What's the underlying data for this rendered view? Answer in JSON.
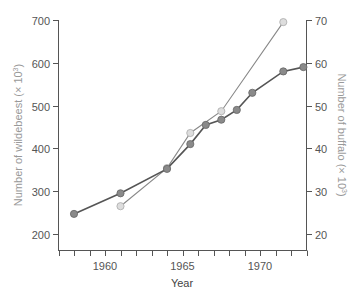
{
  "chart_data": {
    "type": "line",
    "title": "",
    "xlabel": "Year",
    "ylabel_left": "Number of wildebeest (× 10³)",
    "ylabel_right": "Number of buffalo (× 10³)",
    "xlim": [
      1957,
      1973
    ],
    "ylim_left": [
      170,
      700
    ],
    "ylim_right": [
      16,
      70
    ],
    "x_ticks": [
      1960,
      1965,
      1970
    ],
    "y_ticks_left": [
      200,
      300,
      400,
      500,
      600,
      700
    ],
    "y_ticks_right": [
      20,
      30,
      40,
      50,
      60,
      70
    ],
    "grid": false,
    "legend": null,
    "series": [
      {
        "name": "Wildebeest",
        "axis": "left",
        "color": "#555555",
        "marker_fill": "#8a8a8a",
        "x": [
          1958,
          1961,
          1964,
          1965.5,
          1966.5,
          1967.5,
          1968.5,
          1969.5,
          1971.5,
          1972.8
        ],
        "values": [
          247,
          295,
          352,
          410,
          455,
          467,
          490,
          530,
          580,
          590
        ]
      },
      {
        "name": "Buffalo",
        "axis": "right",
        "color": "#888888",
        "marker_fill": "#dddddd",
        "x": [
          1961,
          1964,
          1965.5,
          1967.5,
          1971.5
        ],
        "values": [
          26.5,
          35.4,
          43.6,
          48.7,
          69.5
        ]
      }
    ]
  },
  "axes": {
    "x_title": "Year",
    "y_left_title_main": "Number of wildebeest (× 10",
    "y_left_title_sup": "3",
    "y_right_title_main": "Number of buffalo (× 10",
    "y_right_title_sup": "3",
    "x_tick_labels": [
      "1960",
      "1965",
      "1970"
    ],
    "y_left_tick_labels": [
      "700",
      "600",
      "500",
      "400",
      "300",
      "200"
    ],
    "y_right_tick_labels": [
      "70",
      "60",
      "50",
      "40",
      "30",
      "20"
    ]
  }
}
